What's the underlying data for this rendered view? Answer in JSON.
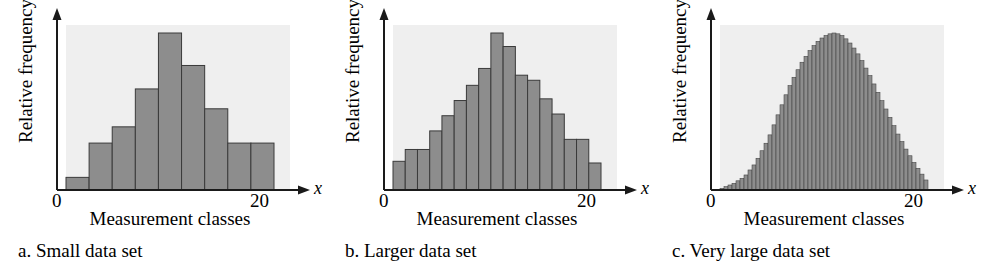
{
  "figure": {
    "background": "#ffffff",
    "panel_count": 3
  },
  "style": {
    "bar_fill": "#8d8d8d",
    "bar_stroke": "#3a3a3a",
    "plot_background": "#efefef",
    "axis_color": "#1a1a1a"
  },
  "panels": [
    {
      "caption": "a. Small data set",
      "ylabel": "Relative frequency",
      "xlabel": "Measurement classes",
      "x_axis_name": "x",
      "tick_min": "0",
      "tick_max": "20"
    },
    {
      "caption": "b. Larger data set",
      "ylabel": "Relative frequency",
      "xlabel": "Measurement classes",
      "x_axis_name": "x",
      "tick_min": "0",
      "tick_max": "20"
    },
    {
      "caption": "c. Very large data set",
      "ylabel": "Relative frequency",
      "xlabel": "Measurement classes",
      "x_axis_name": "x",
      "tick_min": "0",
      "tick_max": "20"
    }
  ],
  "chart_data": [
    {
      "type": "bar",
      "title": "a. Small data set",
      "xlabel": "Measurement classes",
      "ylabel": "Relative frequency",
      "xlim": [
        0,
        20
      ],
      "ylim": [
        0,
        1
      ],
      "xticks": [
        0,
        20
      ],
      "xticklabels": [
        "0",
        "20"
      ],
      "yticks": [],
      "grid": false,
      "legend": false,
      "bin_count": 9,
      "bin_edges": [
        0.9,
        3.0,
        5.1,
        7.2,
        9.3,
        11.4,
        13.5,
        15.6,
        17.7,
        19.8
      ],
      "categories": [
        "0.9-3.0",
        "3.0-5.1",
        "5.1-7.2",
        "7.2-9.3",
        "9.3-11.4",
        "11.4-13.5",
        "13.5-15.6",
        "15.6-17.7",
        "17.7-19.8"
      ],
      "values": [
        0.07,
        0.26,
        0.35,
        0.56,
        0.87,
        0.69,
        0.45,
        0.26,
        0.26
      ]
    },
    {
      "type": "bar",
      "title": "b. Larger data set",
      "xlabel": "Measurement classes",
      "ylabel": "Relative frequency",
      "xlim": [
        0,
        20
      ],
      "ylim": [
        0,
        1
      ],
      "xticks": [
        0,
        20
      ],
      "xticklabels": [
        "0",
        "20"
      ],
      "yticks": [],
      "grid": false,
      "legend": false,
      "bin_count": 17,
      "categories": [
        "1",
        "2",
        "3",
        "4",
        "5",
        "6",
        "7",
        "8",
        "9",
        "10",
        "11",
        "12",
        "13",
        "14",
        "15",
        "16",
        "17"
      ],
      "values": [
        0.17,
        0.24,
        0.24,
        0.35,
        0.44,
        0.53,
        0.62,
        0.72,
        0.93,
        0.85,
        0.68,
        0.65,
        0.54,
        0.45,
        0.3,
        0.3,
        0.16
      ]
    },
    {
      "type": "bar",
      "title": "c. Very large data set",
      "xlabel": "Measurement classes",
      "ylabel": "Relative frequency",
      "xlim": [
        0,
        20
      ],
      "ylim": [
        0,
        1
      ],
      "xticks": [
        0,
        20
      ],
      "xticklabels": [
        "0",
        "20"
      ],
      "yticks": [],
      "grid": false,
      "legend": false,
      "bin_count": 52,
      "description": "Smooth right-skewed bell-shaped histogram of many narrow classes",
      "values": [
        0.01,
        0.02,
        0.03,
        0.04,
        0.055,
        0.07,
        0.09,
        0.12,
        0.15,
        0.19,
        0.235,
        0.28,
        0.33,
        0.39,
        0.45,
        0.51,
        0.57,
        0.625,
        0.675,
        0.72,
        0.765,
        0.8,
        0.835,
        0.865,
        0.89,
        0.91,
        0.925,
        0.935,
        0.94,
        0.935,
        0.925,
        0.905,
        0.88,
        0.85,
        0.815,
        0.775,
        0.73,
        0.685,
        0.635,
        0.585,
        0.535,
        0.485,
        0.435,
        0.385,
        0.335,
        0.29,
        0.245,
        0.205,
        0.165,
        0.13,
        0.095,
        0.06
      ]
    }
  ]
}
